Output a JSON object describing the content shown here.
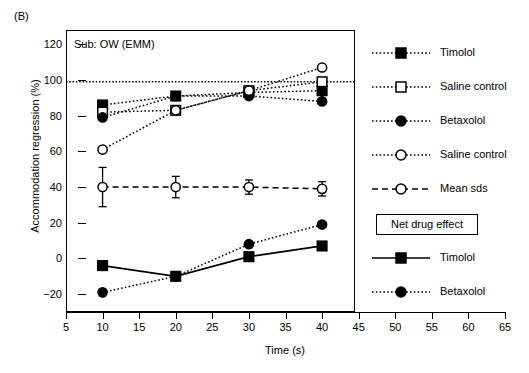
{
  "panel": {
    "label": "(B)"
  },
  "annotation": {
    "subtitle": "Sub: OW (EMM)"
  },
  "axes": {
    "y_title": "Accommodation regression (%)",
    "x_title": "Time (s)",
    "y_ticks": [
      -20,
      0,
      20,
      40,
      60,
      80,
      100,
      120
    ],
    "x_ticks": [
      5,
      10,
      15,
      20,
      25,
      30,
      35,
      40,
      45,
      50,
      55,
      60,
      65
    ],
    "ylim": [
      -30,
      128
    ],
    "xlim": [
      5,
      65
    ]
  },
  "legend": {
    "items": [
      {
        "label": "Timolol",
        "marker": "filled-square",
        "line": "dotted"
      },
      {
        "label": "Saline control",
        "marker": "open-square",
        "line": "dotted"
      },
      {
        "label": "Betaxolol",
        "marker": "filled-circle",
        "line": "dotted"
      },
      {
        "label": "Saline control",
        "marker": "open-circle",
        "line": "dotted"
      },
      {
        "label": "Mean sds",
        "marker": "open-circle",
        "line": "dashed"
      }
    ],
    "net_box_label": "Net drug effect",
    "net_items": [
      {
        "label": "Timolol",
        "marker": "filled-square",
        "line": "solid"
      },
      {
        "label": "Betaxolol",
        "marker": "filled-circle",
        "line": "dotted"
      }
    ]
  },
  "chart_data": {
    "type": "line",
    "title": "Sub: OW (EMM)",
    "xlabel": "Time (s)",
    "ylabel": "Accommodation regression (%)",
    "xlim": [
      5,
      65
    ],
    "ylim": [
      -30,
      128
    ],
    "x": [
      10,
      20,
      30,
      40
    ],
    "grid": false,
    "legend_position": "right",
    "reference_line": {
      "y": 99,
      "style": "dotted"
    },
    "series": [
      {
        "name": "Timolol",
        "marker": "filled-square",
        "line": "dotted",
        "values": [
          86,
          91,
          93,
          94
        ]
      },
      {
        "name": "Saline control (square)",
        "marker": "open-square",
        "line": "dotted",
        "values": [
          82,
          83,
          94,
          99
        ]
      },
      {
        "name": "Betaxolol",
        "marker": "filled-circle",
        "line": "dotted",
        "values": [
          79,
          91,
          91,
          88
        ]
      },
      {
        "name": "Saline control (circle)",
        "marker": "open-circle",
        "line": "dotted",
        "values": [
          61,
          83,
          94,
          107
        ]
      },
      {
        "name": "Mean sds",
        "marker": "open-circle",
        "line": "dashed",
        "values": [
          40,
          40,
          40,
          39
        ],
        "error_up": [
          11,
          6,
          4,
          4
        ],
        "error_down": [
          11,
          6,
          4,
          4
        ]
      },
      {
        "name": "Net drug effect: Timolol",
        "marker": "filled-square",
        "line": "solid",
        "values": [
          -4,
          -10,
          1,
          7
        ]
      },
      {
        "name": "Net drug effect: Betaxolol",
        "marker": "filled-circle",
        "line": "dotted",
        "values": [
          -19,
          -10,
          8,
          19
        ]
      }
    ]
  }
}
